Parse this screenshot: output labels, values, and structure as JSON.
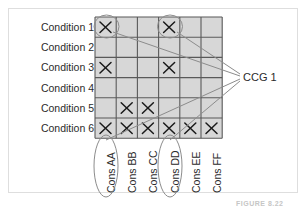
{
  "figure": {
    "caption": "FIGURE 8.22",
    "annotation_label": "CCG 1"
  },
  "matrix": {
    "row_labels": [
      "Condition 1",
      "Condition 2",
      "Condition 3",
      "Condition 4",
      "Condition 5",
      "Condition 6"
    ],
    "column_labels": [
      "Cons AA",
      "Cons BB",
      "Cons CC",
      "Cons DD",
      "Cons EE",
      "Cons FF"
    ],
    "mark_glyph": "X",
    "cells": [
      [
        1,
        0,
        0,
        1,
        0,
        0
      ],
      [
        0,
        0,
        0,
        0,
        0,
        0
      ],
      [
        1,
        0,
        0,
        1,
        0,
        0
      ],
      [
        0,
        0,
        0,
        0,
        0,
        0
      ],
      [
        0,
        1,
        1,
        0,
        0,
        0
      ],
      [
        1,
        1,
        1,
        1,
        1,
        1
      ]
    ],
    "highlighted_cells": [
      {
        "row": 0,
        "col": 0
      },
      {
        "row": 0,
        "col": 3
      }
    ],
    "highlighted_columns": [
      0,
      3
    ]
  },
  "colors": {
    "cell_fill": "#d7d7d7",
    "grid_line": "#595959",
    "mark": "#1a1a1a",
    "annotation_line": "#8c8c8c",
    "ellipse": "#8c8c8c",
    "text": "#2b2b2b",
    "outer_border": "#dedede",
    "caption": "#c6c6c6"
  },
  "geometry": {
    "grid_left": 95,
    "grid_top": 17,
    "cell_width": 21.2,
    "cell_height": 20.2,
    "converge_x": 240,
    "converge_y": 78
  }
}
